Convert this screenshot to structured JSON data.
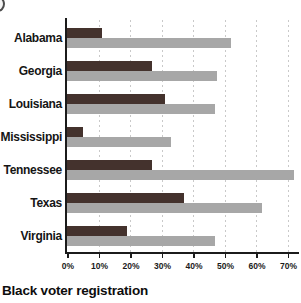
{
  "title": "Black voter registration",
  "decorations": {
    "corner_icon": "cropped-circle-icon"
  },
  "colors": {
    "series1": "#44322d",
    "series2": "#a7a7a7",
    "grid": "#c9c9c9",
    "axis": "#1b1b1b",
    "text": "#111111",
    "background": "#ffffff"
  },
  "chart_data": {
    "type": "bar",
    "orientation": "horizontal",
    "title": "Black voter registration",
    "xlabel": "",
    "ylabel": "",
    "categories": [
      "Alabama",
      "Georgia",
      "Louisiana",
      "Mississippi",
      "Tennessee",
      "Texas",
      "Virginia"
    ],
    "series": [
      {
        "name": "dark-red-series",
        "color": "#44322d",
        "values": [
          11,
          27,
          31,
          5,
          27,
          37,
          19
        ]
      },
      {
        "name": "gray-series",
        "color": "#a7a7a7",
        "values": [
          52,
          47.5,
          47,
          33,
          72,
          62,
          47
        ]
      }
    ],
    "x_ticks": [
      "0%",
      "10%",
      "20%",
      "30%",
      "40%",
      "50%",
      "60%",
      "70%"
    ],
    "x_tick_values": [
      0,
      10,
      20,
      30,
      40,
      50,
      60,
      70
    ],
    "xlim": [
      0,
      73
    ],
    "grid": true,
    "legend": false
  }
}
